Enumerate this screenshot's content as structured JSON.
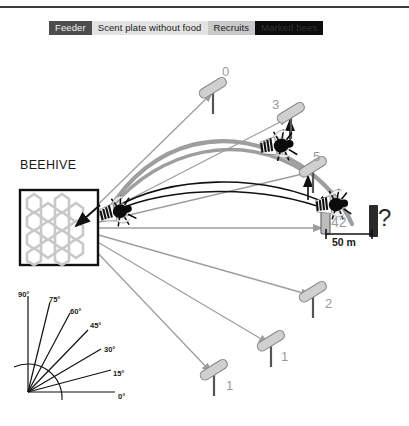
{
  "figure": {
    "beehive_label": "BEEHIVE",
    "scale_label": "50 m",
    "unknown_marker": "?"
  },
  "legend": {
    "items": [
      {
        "label": "Feeder",
        "color": "#4d4d4d",
        "text_color": "#f2f2f2"
      },
      {
        "label": "Scent plate without food",
        "color": "#e3e3e3",
        "text_color": "#1a1a1a"
      },
      {
        "label": "Recruits",
        "color": "#c9c9c9",
        "text_color": "#1a1a1a"
      },
      {
        "label": "Marked bees",
        "color": "#0d0d0d",
        "text_color": "#2f2f2f"
      }
    ]
  },
  "scent_plates": [
    {
      "id": "plate-0",
      "count": "0"
    },
    {
      "id": "plate-3",
      "count": "3"
    },
    {
      "id": "plate-5",
      "count": "5"
    },
    {
      "id": "plate-2",
      "count": "2"
    },
    {
      "id": "plate-1-mid",
      "count": "1"
    },
    {
      "id": "plate-1-low",
      "count": "1"
    }
  ],
  "feeder": {
    "count": "42"
  },
  "angle_scale": {
    "ticks": [
      "0°",
      "15°",
      "30°",
      "45°",
      "60°",
      "75°",
      "90°"
    ]
  },
  "colors": {
    "recruit_path": "#9e9e9e",
    "marked_path": "#111111",
    "plate_fill": "#d0d0d0",
    "feeder_fill": "#2b2b2b",
    "hive_comb": "#c8c8c8"
  }
}
